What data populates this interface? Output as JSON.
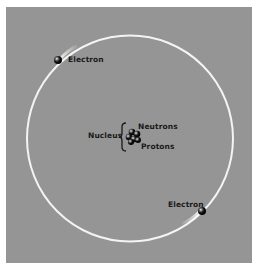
{
  "diagram": {
    "background_color": "#959595",
    "orbit_color": "#ffffff",
    "labels": {
      "electron_top": "Electron",
      "electron_bottom": "Electron",
      "nucleus": "Nucleus",
      "neutrons": "Neutrons",
      "protons": "Protons"
    },
    "nodes": [
      {
        "id": "nucleus",
        "label": "Nucleus",
        "parts": [
          "Neutrons",
          "Protons"
        ]
      },
      {
        "id": "electron-1",
        "label": "Electron",
        "position": "upper-left on orbit"
      },
      {
        "id": "electron-2",
        "label": "Electron",
        "position": "lower-right on orbit"
      }
    ],
    "edges": [
      {
        "from": "electron-1",
        "to": "nucleus",
        "type": "orbit"
      },
      {
        "from": "electron-2",
        "to": "nucleus",
        "type": "orbit"
      }
    ]
  }
}
